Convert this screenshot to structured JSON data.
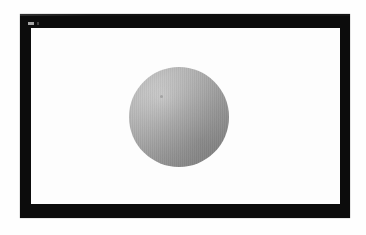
{
  "scene": {
    "title": "Rendered Sphere Viewport",
    "canvas": {
      "width_px": 366,
      "height_px": 235,
      "background_color": "#fefefe"
    },
    "frame": {
      "name": "black-bezel",
      "color": "#0c0c0c",
      "x": 20,
      "y": 14,
      "width": 330,
      "height": 204,
      "border_thickness_px": 12
    },
    "viewport": {
      "name": "render-area",
      "background_color": "#fdfdfd",
      "x": 31,
      "y": 28,
      "width": 309,
      "height": 176
    },
    "bezel_marker": {
      "name": "bezel-marker",
      "color": "#b9b9b9",
      "x": 28,
      "y": 22,
      "width": 6,
      "height": 3
    },
    "object": {
      "name": "shaded-sphere",
      "shape": "sphere",
      "center_x": 179,
      "center_y": 117,
      "radius_px": 50,
      "diameter_px": 100,
      "base_color": "#a6a6a6",
      "highlight_color": "#cfcfcf",
      "shadow_color": "#8c8c8c",
      "highlight_position": "upper-left",
      "highlight_x_pct": 33,
      "highlight_y_pct": 30,
      "shading_model": "diffuse-radial-gradient",
      "banding_artifact": "vertical-dither"
    }
  }
}
